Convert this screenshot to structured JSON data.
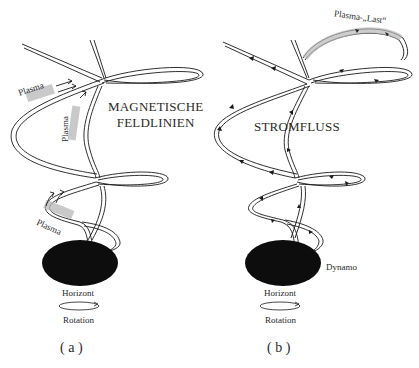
{
  "figure": {
    "panels": [
      {
        "id": "a",
        "caption": "( a )",
        "labels": {
          "title_line1": "MAGNETISCHE",
          "title_line2": "FELDLINIEN",
          "plasma_1": "Plasma",
          "plasma_2": "Plasma",
          "plasma_3": "Plasma",
          "horizon": "Horizont",
          "rotation": "Rotation"
        }
      },
      {
        "id": "b",
        "caption": "( b )",
        "labels": {
          "title": "STROMFLUSS",
          "plasma_load": "Plasma-„Last“",
          "dynamo": "Dynamo",
          "horizon": "Horizont",
          "rotation": "Rotation"
        }
      }
    ],
    "colors": {
      "ink": "#1a1a1a",
      "body": "#0d0d0d",
      "plasma_shade": "#b8b8b8",
      "background": "#ffffff"
    }
  }
}
